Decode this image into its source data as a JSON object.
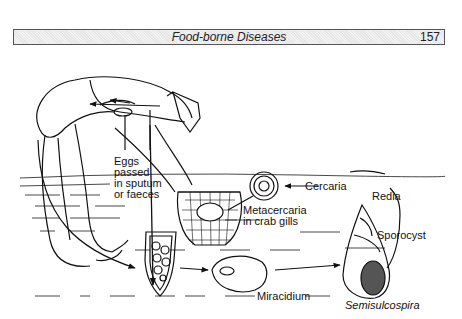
{
  "header": {
    "title": "Food-borne Diseases",
    "page_number": "157"
  },
  "diagram": {
    "labels": {
      "eggs": [
        "Eggs",
        "passed",
        "in sputum",
        "or faeces"
      ],
      "metacercaria": [
        "Metacercaria",
        "in crab gills"
      ],
      "cercaria": "Cercaria",
      "redia": "Redia",
      "sporocyst": "Sporocyst",
      "miracidium": "Miracidium",
      "snail": "Semisulcospira"
    },
    "icons": [
      "human-figure",
      "crab-basket",
      "metacercaria-cyst",
      "egg",
      "miracidium",
      "snail-shell"
    ]
  }
}
